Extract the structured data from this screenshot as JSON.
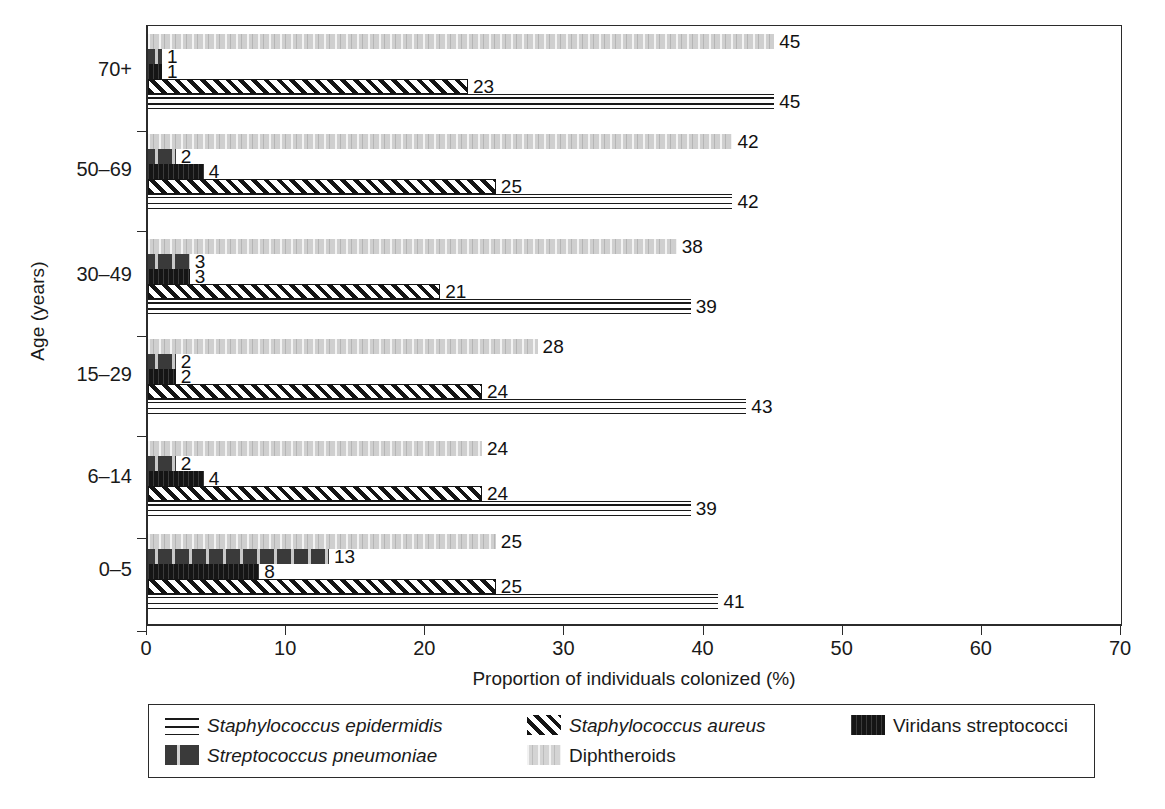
{
  "chart_data": {
    "type": "bar",
    "orientation": "horizontal",
    "title": "",
    "xlabel": "Proportion of individuals colonized (%)",
    "ylabel": "Age (years)",
    "xlim": [
      0,
      70
    ],
    "xticks": [
      0,
      10,
      20,
      30,
      40,
      50,
      60,
      70
    ],
    "grid": false,
    "legend_position": "bottom",
    "categories": [
      "0–5",
      "6–14",
      "15–29",
      "30–49",
      "50–69",
      "70+"
    ],
    "series": [
      {
        "name": "Staphylococcus epidermidis",
        "pattern": "horizontal-lines",
        "italic": true,
        "values": [
          41,
          39,
          43,
          39,
          42,
          45
        ]
      },
      {
        "name": "Staphylococcus aureus",
        "pattern": "diagonal-hatch",
        "italic": true,
        "values": [
          25,
          24,
          24,
          21,
          25,
          23
        ]
      },
      {
        "name": "Viridans streptococci",
        "pattern": "solid-black",
        "italic": false,
        "values": [
          8,
          4,
          2,
          3,
          4,
          1
        ]
      },
      {
        "name": "Streptococcus pneumoniae",
        "pattern": "dark-grey-arrows",
        "italic": true,
        "values": [
          13,
          2,
          2,
          3,
          2,
          1
        ]
      },
      {
        "name": "Diphtheroids",
        "pattern": "light-grey-speckle",
        "italic": false,
        "values": [
          25,
          24,
          28,
          38,
          42,
          45
        ]
      }
    ],
    "bar_order_top_to_bottom": [
      "Diphtheroids",
      "Streptococcus pneumoniae",
      "Viridans streptococci",
      "Staphylococcus aureus",
      "Staphylococcus epidermidis"
    ]
  },
  "axes": {
    "y_title": "Age (years)",
    "x_title": "Proportion of individuals colonized (%)",
    "y_tick_labels": [
      "70+",
      "50–69",
      "30–49",
      "15–29",
      "6–14",
      "0–5"
    ],
    "x_tick_labels": [
      "0",
      "10",
      "20",
      "30",
      "40",
      "50",
      "60",
      "70"
    ]
  },
  "legend": {
    "items": [
      {
        "label": "Staphylococcus epidermidis",
        "swatch": "horizontal-lines-swatch",
        "italic": true
      },
      {
        "label": "Staphylococcus aureus",
        "swatch": "diagonal-hatch-swatch",
        "italic": true
      },
      {
        "label": "Viridans streptococci",
        "swatch": "solid-black-swatch",
        "italic": false
      },
      {
        "label": "Streptococcus pneumoniae",
        "swatch": "dark-grey-arrows-swatch",
        "italic": true
      },
      {
        "label": "Diphtheroids",
        "swatch": "light-grey-speckle-swatch",
        "italic": false
      }
    ]
  },
  "colors": {
    "axis": "#2b2b2b",
    "diphtheroids": "#cfcfcf",
    "pneumoniae": "#3a3a3a",
    "viridans": "#151515",
    "aureus": "#141414",
    "epidermidis": "#1a1a1a"
  },
  "bar_labels": {
    "groups": [
      {
        "age": "70+",
        "values": [
          45,
          1,
          1,
          23,
          45
        ]
      },
      {
        "age": "50–69",
        "values": [
          42,
          2,
          4,
          25,
          42
        ]
      },
      {
        "age": "30–49",
        "values": [
          38,
          3,
          3,
          21,
          39
        ]
      },
      {
        "age": "15–29",
        "values": [
          28,
          2,
          2,
          24,
          43
        ]
      },
      {
        "age": "6–14",
        "values": [
          24,
          2,
          4,
          24,
          39
        ]
      },
      {
        "age": "0–5",
        "values": [
          25,
          13,
          8,
          25,
          41
        ]
      }
    ]
  }
}
